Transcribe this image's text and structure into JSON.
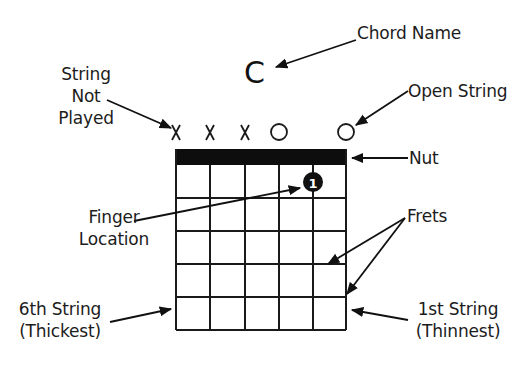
{
  "diagram": {
    "chord_name": "C",
    "labels": {
      "chord_name": "Chord Name",
      "string_not_played": [
        "String",
        "Not",
        "Played"
      ],
      "open_string": "Open String",
      "nut": "Nut",
      "finger_location": [
        "Finger",
        "Location"
      ],
      "frets": "Frets",
      "sixth_string": [
        "6th String",
        "(Thickest)"
      ],
      "first_string": [
        "1st String",
        "(Thinnest)"
      ]
    },
    "string_markers": [
      "X",
      "X",
      "X",
      "O",
      "",
      "O"
    ],
    "finger_dot": {
      "number": "1",
      "string": 5,
      "fret": 1
    },
    "grid": {
      "strings": 6,
      "frets": 5
    },
    "colors": {
      "ink": "#111111",
      "background": "#ffffff"
    }
  }
}
